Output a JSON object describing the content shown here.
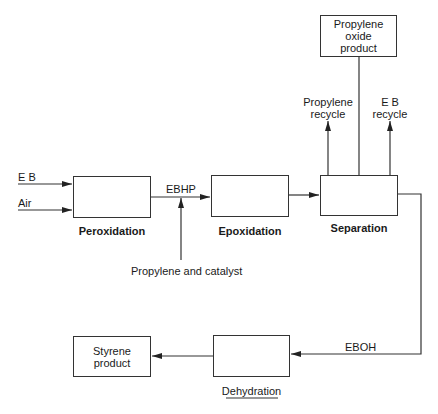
{
  "diagram": {
    "inputs": {
      "eb": "E B",
      "air": "Air"
    },
    "units": {
      "peroxidation": "Peroxidation",
      "epoxidation": "Epoxidation",
      "separation": "Separation",
      "dehydration": "Dehydration"
    },
    "streams": {
      "ebhp": "EBHP",
      "propylene_catalyst": "Propylene and catalyst",
      "propylene_recycle_1": "Propylene",
      "propylene_recycle_2": "recycle",
      "eb_recycle_1": "E B",
      "eb_recycle_2": "recycle",
      "eboh": "EBOH"
    },
    "products": {
      "propylene_oxide_1": "Propylene",
      "propylene_oxide_2": "oxide",
      "propylene_oxide_3": "product",
      "styrene_1": "Styrene",
      "styrene_2": "product"
    }
  }
}
